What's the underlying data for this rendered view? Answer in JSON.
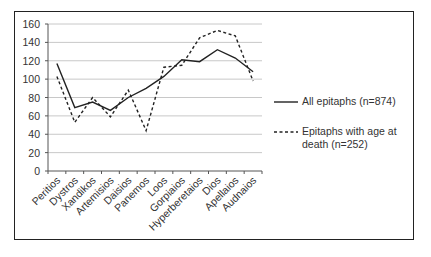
{
  "chart_data": {
    "type": "line",
    "title": "",
    "xlabel": "",
    "ylabel": "",
    "ylim": [
      0,
      160
    ],
    "yticks": [
      0,
      20,
      40,
      60,
      80,
      100,
      120,
      140,
      160
    ],
    "grid": true,
    "legend_position": "right",
    "categories": [
      "Peritios",
      "Dystros",
      "Xandikos",
      "Artemisios",
      "Daisios",
      "Panemos",
      "Loos",
      "Gorpiaios",
      "Hyperberetaios",
      "Dios",
      "Apellaios",
      "Audnaios"
    ],
    "series": [
      {
        "name": "All epitaphs  (n=874)",
        "style": "solid",
        "values": [
          117,
          69,
          75,
          66,
          80,
          90,
          103,
          121,
          119,
          132,
          123,
          108
        ]
      },
      {
        "name": "Epitaphs with age at death (n=252)",
        "style": "dashed",
        "values": [
          103,
          53,
          80,
          59,
          88,
          44,
          113,
          115,
          145,
          153,
          147,
          98
        ]
      }
    ]
  },
  "legend": {
    "solid_label": "All epitaphs  (n=874)",
    "dashed_label_line1": "Epitaphs with age at",
    "dashed_label_line2": "death (n=252)"
  },
  "colors": {
    "line": "#222222",
    "grid": "#c8c8c8",
    "text": "#333333"
  }
}
